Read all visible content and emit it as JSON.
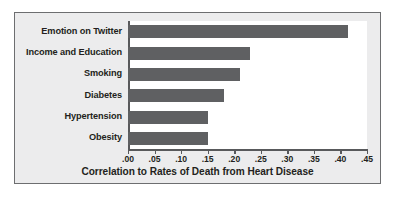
{
  "chart_data": {
    "type": "bar",
    "orientation": "horizontal",
    "title": "",
    "xlabel": "Correlation to Rates of Death from Heart Disease",
    "ylabel": "",
    "categories": [
      "Emotion on Twitter",
      "Income and Education",
      "Smoking",
      "Diabetes",
      "Hypertension",
      "Obesity"
    ],
    "values": [
      0.415,
      0.23,
      0.21,
      0.18,
      0.15,
      0.15
    ],
    "xlim": [
      0.0,
      0.45
    ],
    "xticks": [
      0.0,
      0.05,
      0.1,
      0.15,
      0.2,
      0.25,
      0.3,
      0.35,
      0.4,
      0.45
    ],
    "xtick_labels": [
      ".00",
      ".05",
      ".10",
      ".15",
      ".20",
      ".25",
      ".30",
      ".35",
      ".40",
      ".45"
    ],
    "grid": false,
    "legend": false,
    "bar_color": "#5f6062",
    "plot_background": "#ffffff",
    "panel_background": "#ececed",
    "border_color": "#6d6e70",
    "text_color": "#231f20"
  }
}
